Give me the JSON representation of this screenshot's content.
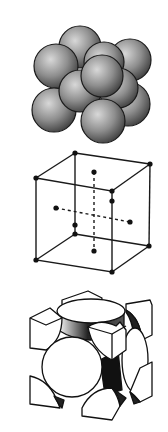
{
  "figure": {
    "panels": [
      {
        "id": "hard-sphere-model",
        "description": "Packed hard-sphere atoms"
      },
      {
        "id": "lattice-point-model",
        "description": "Cube with corner and face-center lattice points"
      },
      {
        "id": "cut-sphere-unit-cell",
        "description": "Unit cell with sectioned atoms"
      }
    ]
  },
  "colors": {
    "sphere_dark": "#3a3a3a",
    "sphere_mid": "#8a8a8a",
    "sphere_light": "#d6d6d6",
    "line": "#1a1a1a",
    "background": "#ffffff"
  }
}
